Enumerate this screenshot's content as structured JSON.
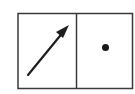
{
  "diagram": {
    "panels": [
      {
        "name": "left-panel",
        "content": "arrow-icon",
        "description": "diagonal arrow pointing up-right"
      },
      {
        "name": "right-panel",
        "content": "dot-icon",
        "description": "solid dot"
      }
    ],
    "colors": {
      "stroke": "#2a2a2a",
      "background": "#ffffff"
    }
  }
}
